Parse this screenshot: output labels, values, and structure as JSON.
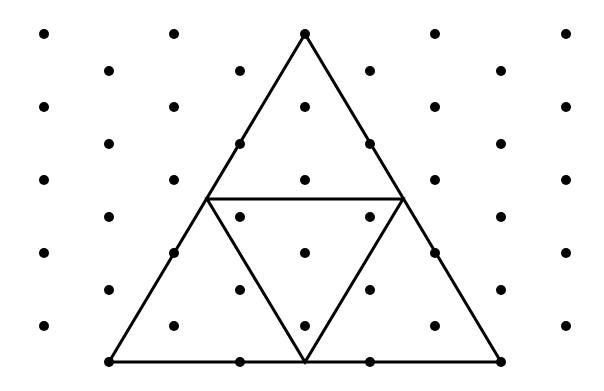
{
  "diagram": {
    "colors": {
      "background": "#ffffff",
      "ink": "#000000"
    },
    "grid": {
      "type": "isometric-dot-grid",
      "dot_radius": 5,
      "columns_x": [
        44,
        109,
        174,
        240,
        305,
        370,
        435,
        501,
        566
      ],
      "rows_y": [
        34,
        71,
        107,
        144,
        180,
        217,
        253,
        290,
        326,
        362
      ],
      "even_row_columns": [
        0,
        2,
        4,
        6,
        8
      ],
      "odd_row_columns": [
        1,
        3,
        5,
        7
      ]
    },
    "outer_triangle": {
      "vertices": [
        [
          305,
          34
        ],
        [
          109,
          362
        ],
        [
          501,
          362
        ]
      ],
      "stroke_width": 3
    },
    "inner_triangle": {
      "vertices": [
        [
          207,
          199
        ],
        [
          403,
          199
        ],
        [
          305,
          362
        ]
      ],
      "stroke_width": 3,
      "description": "Medial triangle connecting midpoints of the outer triangle's sides"
    }
  }
}
